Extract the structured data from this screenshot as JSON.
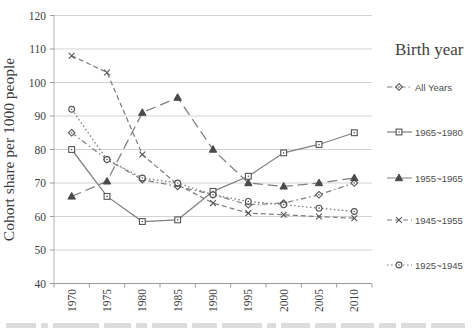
{
  "chart_data": {
    "type": "line",
    "title": "",
    "xlabel": "",
    "ylabel": "Cohort share per 1000 people",
    "x_categories": [
      "1970",
      "1975",
      "1980",
      "1985",
      "1990",
      "1995",
      "2000",
      "2005",
      "2010"
    ],
    "ylim": [
      40,
      120
    ],
    "ytick_step": 10,
    "grid": "horizontal",
    "legend_title": "Birth year",
    "legend_position": "right",
    "series": [
      {
        "name": "All Years",
        "marker": "diamond",
        "line": "dash-dot",
        "values": [
          85,
          77,
          71,
          69,
          66.5,
          63.5,
          64,
          66.5,
          70
        ]
      },
      {
        "name": "1965~1980",
        "marker": "square",
        "line": "solid",
        "values": [
          80,
          66,
          58.5,
          59,
          67.5,
          72,
          79,
          81.5,
          85
        ]
      },
      {
        "name": "1955~1965",
        "marker": "triangle",
        "line": "long-dash",
        "values": [
          66,
          70.5,
          91,
          95.5,
          80,
          70,
          69,
          70,
          71.5
        ]
      },
      {
        "name": "1945~1955",
        "marker": "x",
        "line": "dash",
        "values": [
          108,
          103,
          78.5,
          69.5,
          64,
          61,
          60.5,
          60,
          59.5
        ]
      },
      {
        "name": "1925~1945",
        "marker": "circle",
        "line": "dot",
        "values": [
          92,
          77,
          71.5,
          70,
          66.5,
          64.5,
          63.5,
          62.5,
          61.5
        ]
      }
    ],
    "colors": {
      "line": "#7f7f7f",
      "marker": "#545454",
      "grid": "#d3d3d3",
      "axis": "#9b9b9b",
      "text": "#3f3f3f"
    }
  }
}
